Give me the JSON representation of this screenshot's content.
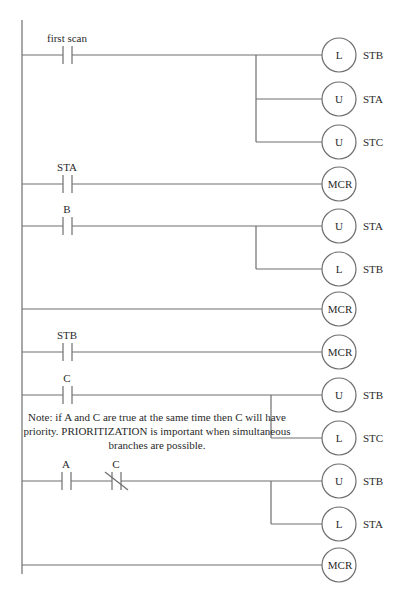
{
  "diagram": {
    "type": "ladder-logic",
    "rails": {
      "left_x": 22,
      "top_y": 20,
      "bottom_y": 574
    },
    "line_color": "#6e6e6e",
    "rungs": [
      {
        "id": "r1",
        "y": 55,
        "contacts": [
          {
            "label": "first scan",
            "type": "NO",
            "x": 63
          }
        ],
        "branch_x": 256,
        "coils": [
          {
            "y": 55,
            "letter": "L",
            "tag": "STB"
          },
          {
            "y": 99,
            "letter": "U",
            "tag": "STA"
          },
          {
            "y": 142,
            "letter": "U",
            "tag": "STC"
          }
        ]
      },
      {
        "id": "r2",
        "y": 184,
        "contacts": [
          {
            "label": "STA",
            "type": "NO",
            "x": 63
          }
        ],
        "coils": [
          {
            "y": 184,
            "letter": "MCR",
            "tag": ""
          }
        ]
      },
      {
        "id": "r3",
        "y": 226,
        "contacts": [
          {
            "label": "B",
            "type": "NO",
            "x": 63
          }
        ],
        "branch_x": 256,
        "coils": [
          {
            "y": 226,
            "letter": "U",
            "tag": "STA"
          },
          {
            "y": 269,
            "letter": "L",
            "tag": "STB"
          }
        ]
      },
      {
        "id": "r4",
        "y": 309,
        "contacts": [],
        "coils": [
          {
            "y": 309,
            "letter": "MCR",
            "tag": ""
          }
        ]
      },
      {
        "id": "r5",
        "y": 352,
        "contacts": [
          {
            "label": "STB",
            "type": "NO",
            "x": 63
          }
        ],
        "coils": [
          {
            "y": 352,
            "letter": "MCR",
            "tag": ""
          }
        ]
      },
      {
        "id": "r6",
        "y": 395,
        "contacts": [
          {
            "label": "C",
            "type": "NO",
            "x": 63
          }
        ],
        "branch_x": 271,
        "coils": [
          {
            "y": 395,
            "letter": "U",
            "tag": "STB"
          },
          {
            "y": 438,
            "letter": "L",
            "tag": "STC"
          }
        ]
      },
      {
        "id": "r7",
        "y": 481,
        "contacts": [
          {
            "label": "A",
            "type": "NO",
            "x": 62
          },
          {
            "label": "C",
            "type": "NC",
            "x": 112
          }
        ],
        "branch_x": 271,
        "coils": [
          {
            "y": 481,
            "letter": "U",
            "tag": "STB"
          },
          {
            "y": 524,
            "letter": "L",
            "tag": "STA"
          }
        ]
      },
      {
        "id": "r8",
        "y": 565,
        "contacts": [],
        "coils": [
          {
            "y": 565,
            "letter": "MCR",
            "tag": ""
          }
        ]
      }
    ],
    "coil_center_x": 339,
    "coil_radius": 17,
    "note": "Note: if A and C are true at the same time then C will have priority. PRIORITIZATION is important when simultaneous branches are possible."
  }
}
